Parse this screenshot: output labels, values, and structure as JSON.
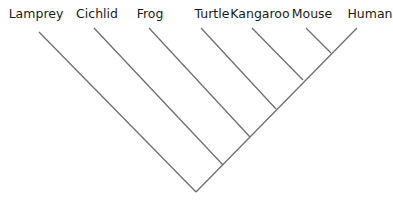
{
  "diagram": {
    "type": "cladogram",
    "taxa": [
      {
        "name": "Lamprey",
        "x": 36
      },
      {
        "name": "Cichlid",
        "x": 97
      },
      {
        "name": "Frog",
        "x": 150
      },
      {
        "name": "Turtle",
        "x": 212
      },
      {
        "name": "Kangaroo",
        "x": 260
      },
      {
        "name": "Mouse",
        "x": 312
      },
      {
        "name": "Human",
        "x": 370
      }
    ],
    "branches": [
      {
        "from": "root",
        "to": "Lamprey",
        "x1": 196,
        "y1": 192,
        "x2": 39,
        "y2": 32
      },
      {
        "from": "node-1",
        "to": "Cichlid",
        "x1": 223,
        "y1": 165,
        "x2": 94,
        "y2": 28
      },
      {
        "from": "node-2",
        "to": "Frog",
        "x1": 250,
        "y1": 137,
        "x2": 149,
        "y2": 28
      },
      {
        "from": "node-3",
        "to": "Turtle",
        "x1": 275,
        "y1": 110,
        "x2": 201,
        "y2": 28
      },
      {
        "from": "node-4",
        "to": "Kangaroo",
        "x1": 303,
        "y1": 80,
        "x2": 252,
        "y2": 28
      },
      {
        "from": "node-5",
        "to": "Mouse",
        "x1": 331,
        "y1": 53,
        "x2": 306,
        "y2": 28
      },
      {
        "from": "root",
        "to": "Human",
        "x1": 196,
        "y1": 192,
        "x2": 357,
        "y2": 28
      }
    ],
    "line_color": "#6e6e6e",
    "text_color": "#1a1a1a",
    "background": "#ffffff"
  }
}
